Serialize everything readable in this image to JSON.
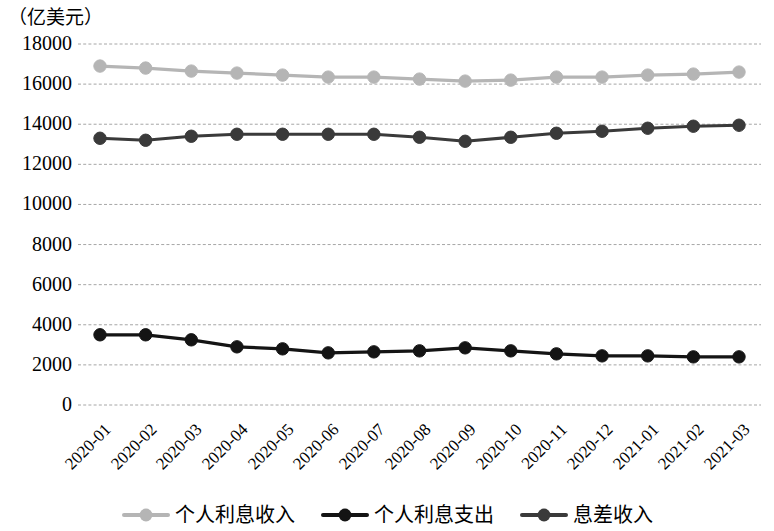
{
  "chart_data": {
    "type": "line",
    "title": "",
    "subtitle": "",
    "xlabel": "",
    "ylabel": "（亿美元）",
    "ylim": [
      0,
      18000
    ],
    "ytick_step": 2000,
    "yticks": [
      18000,
      16000,
      14000,
      12000,
      10000,
      8000,
      6000,
      4000,
      2000,
      0
    ],
    "grid": true,
    "legend_position": "bottom",
    "categories": [
      "2020-01",
      "2020-02",
      "2020-03",
      "2020-04",
      "2020-05",
      "2020-06",
      "2020-07",
      "2020-08",
      "2020-09",
      "2020-10",
      "2020-11",
      "2020-12",
      "2021-01",
      "2021-02",
      "2021-03"
    ],
    "series": [
      {
        "name": "个人利息收入",
        "color": "#b5b5b5",
        "values": [
          16900,
          16800,
          16650,
          16550,
          16450,
          16350,
          16350,
          16250,
          16150,
          16200,
          16350,
          16350,
          16450,
          16500,
          16600
        ]
      },
      {
        "name": "个人利息支出",
        "color": "#141414",
        "values": [
          3500,
          3500,
          3250,
          2900,
          2800,
          2600,
          2650,
          2700,
          2850,
          2700,
          2550,
          2450,
          2450,
          2400,
          2400
        ]
      },
      {
        "name": "息差收入",
        "color": "#3a3a3a",
        "values": [
          13300,
          13200,
          13400,
          13500,
          13500,
          13500,
          13500,
          13350,
          13150,
          13350,
          13550,
          13650,
          13800,
          13900,
          13950
        ]
      }
    ]
  },
  "legend": {
    "items": [
      {
        "label": "个人利息收入",
        "icon": "line-marker-icon",
        "color": "#b5b5b5"
      },
      {
        "label": "个人利息支出",
        "icon": "line-marker-icon",
        "color": "#141414"
      },
      {
        "label": "息差收入",
        "icon": "line-marker-icon",
        "color": "#3a3a3a"
      }
    ]
  }
}
